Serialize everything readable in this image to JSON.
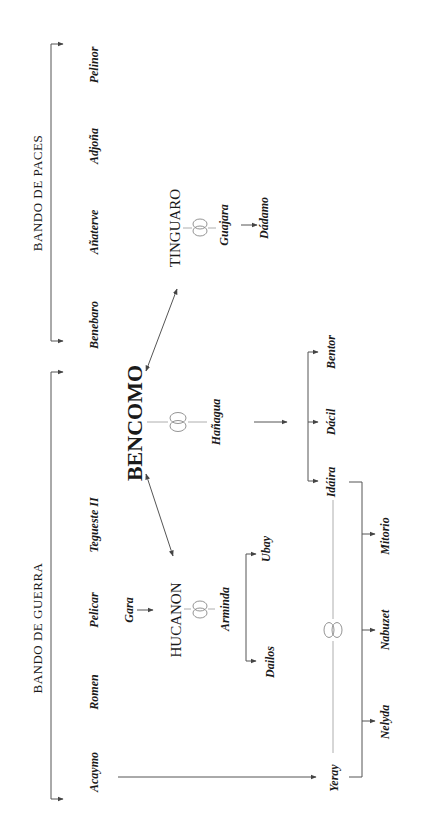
{
  "diagram": {
    "orientation": "rotated-90-ccw",
    "factions": {
      "war": {
        "label": "BANDO DE GUERRA",
        "members": [
          "Tegueste II",
          "Pelicar",
          "Romen",
          "Acaymo"
        ]
      },
      "peace": {
        "label": "BANDO DE PACES",
        "members": [
          "Benebaro",
          "Añaterve",
          "Adjoña",
          "Pelinor"
        ]
      }
    },
    "people": {
      "bencomo": "BENCOMO",
      "tinguaro": "TINGUARO",
      "hucanon": "HUCANON",
      "gara": "Gara",
      "guajara": "Guajara",
      "dadamo": "Dádamo",
      "hanagua": "Hañagua",
      "arminda": "Arminda",
      "dailos": "Dailos",
      "ubay": "Ubay",
      "idaira": "Idáira",
      "dacil": "Dácil",
      "bentor": "Bentor",
      "yeray": "Yeray",
      "nelyda": "Nelyda",
      "nabuzet": "Nabuzet",
      "mitorio": "Mitorio",
      "tegueste": "Tegueste II",
      "pelicar": "Pelicar",
      "romen": "Romen",
      "acaymo": "Acaymo",
      "benebaro": "Benebaro",
      "anaterve": "Añaterve",
      "adjona": "Adjoña",
      "pelinor": "Pelinor"
    },
    "marriage_symbol": "marriage-rings-icon",
    "colors": {
      "text": "#1a1a1a",
      "line": "#555555",
      "marriage_line": "#9a9a9a"
    }
  }
}
